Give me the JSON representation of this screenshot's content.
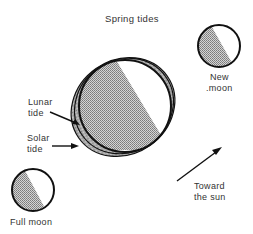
{
  "title": "Spring tides",
  "labels": {
    "new_moon": [
      "New",
      ".moon"
    ],
    "full_moon": "Full moon",
    "lunar_tide": [
      "Lunar",
      "tide"
    ],
    "solar_tide": [
      "Solar",
      "tide"
    ],
    "sun_direction": [
      "Toward",
      "the sun"
    ]
  },
  "colors": {
    "outline": "#111111",
    "shade": "#9a9a9a",
    "background": "#ffffff"
  }
}
